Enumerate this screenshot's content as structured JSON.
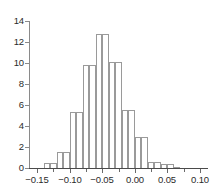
{
  "chart_data": {
    "type": "bar",
    "subtype": "histogram",
    "title": "",
    "xlabel": "",
    "ylabel": "",
    "xlim": [
      -0.1625,
      0.1125
    ],
    "ylim": [
      0,
      14
    ],
    "grid": false,
    "legend": null,
    "xticks": [
      -0.15,
      -0.1,
      -0.05,
      0.0,
      0.05,
      0.1
    ],
    "xtick_labels": [
      "−0.15",
      "−0.10",
      "−0.05",
      "0.00",
      "0.05",
      "0.10"
    ],
    "yticks": [
      0,
      2,
      4,
      6,
      8,
      10,
      12,
      14
    ],
    "ytick_labels": [
      "0",
      "2",
      "4",
      "6",
      "8",
      "10",
      "12",
      "14"
    ],
    "bin_width": 0.01,
    "bin_edges": [
      -0.14,
      -0.13,
      -0.12,
      -0.11,
      -0.1,
      -0.09,
      -0.08,
      -0.07,
      -0.06,
      -0.05,
      -0.04,
      -0.03,
      -0.02,
      -0.01,
      0.0,
      0.01,
      0.02,
      0.03,
      0.04,
      0.05,
      0.06,
      0.07
    ],
    "values": [
      0.5,
      0.5,
      1.5,
      1.5,
      5.3,
      5.3,
      9.8,
      9.8,
      12.8,
      12.8,
      10.1,
      10.1,
      5.5,
      5.5,
      3.0,
      3.0,
      0.6,
      0.6,
      0.4,
      0.4,
      0.1
    ],
    "bar_outline_color": "#9a9a9a",
    "bar_fill_color": "#ffffff",
    "axis_color": "#4a4a4a",
    "text_color": "#2b2b2b"
  }
}
